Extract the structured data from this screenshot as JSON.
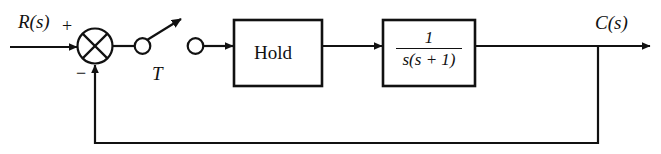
{
  "diagram": {
    "type": "control-system-block-diagram",
    "stroke_color": "#111111",
    "background_color": "#ffffff",
    "input_label": "R(s)",
    "output_label": "C(s)",
    "summing_junction": {
      "name": "summing-junction",
      "style": "circle-with-x-cross",
      "plus_sign": "+",
      "minus_sign": "−",
      "plus_input": "reference",
      "minus_input": "feedback"
    },
    "sampler": {
      "name": "sampler-switch",
      "period_label": "T",
      "description": "ideal sampler drawn as two contacts with an open switch arm"
    },
    "blocks": [
      {
        "name": "hold-block",
        "label": "Hold",
        "label_kind": "text"
      },
      {
        "name": "plant-block",
        "label_kind": "fraction",
        "numerator": "1",
        "denominator": "s(s + 1)"
      }
    ],
    "feedback": {
      "name": "feedback-path",
      "kind": "unity-negative-feedback"
    }
  }
}
